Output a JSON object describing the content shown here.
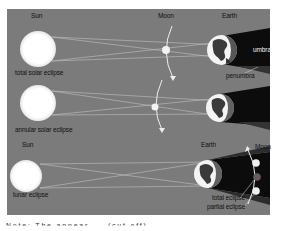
{
  "figure": {
    "panel_color": "#7b7b7b",
    "rows": [
      {
        "id": "total-solar-eclipse",
        "caption": "total solar eclipse",
        "labels": {
          "sun": "Sun",
          "moon": "Moon",
          "earth": "Earth",
          "umbra": "umbra",
          "penumbra": "penumbra"
        }
      },
      {
        "id": "annular-solar-eclipse",
        "caption": "annular solar eclipse"
      },
      {
        "id": "lunar-eclipse",
        "caption": "lunar eclipse",
        "labels": {
          "sun": "Sun",
          "earth": "Earth",
          "moon": "Moon",
          "total": "total eclipse",
          "partial": "partial eclipse"
        }
      }
    ],
    "colors": {
      "sun": "#ffffff",
      "earth_ocean": "#f4f4f4",
      "earth_land": "#3a3a3a",
      "shadow": "#0b0b0b",
      "ray": "#c8c8c8",
      "moon_lit": "#f0f0f0",
      "moon_eclipsed": "#6a5a5a"
    },
    "footer_cutoff": "Note: The appear ... (cut off)"
  }
}
